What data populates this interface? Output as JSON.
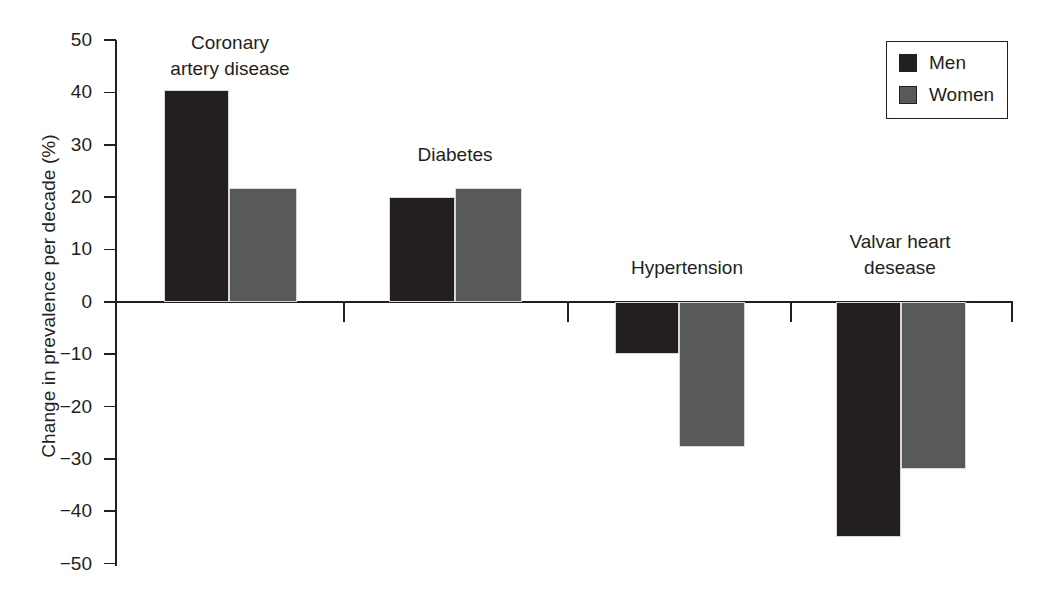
{
  "chart_data": {
    "type": "bar",
    "title": "",
    "xlabel": "",
    "ylabel": "Change in prevalence per decade (%)",
    "categories": [
      "Coronary\nartery disease",
      "Diabetes",
      "Hypertension",
      "Valvar heart\ndesease"
    ],
    "series": [
      {
        "name": "Men",
        "color": "#231f20",
        "values": [
          40.5,
          20.0,
          -10.0,
          -45.0
        ]
      },
      {
        "name": "Women",
        "color": "#58595b",
        "values": [
          21.8,
          21.8,
          -27.7,
          -32.0
        ]
      }
    ],
    "ylim": [
      -50,
      50
    ],
    "yticks": [
      50,
      40,
      30,
      20,
      10,
      0,
      -10,
      -20,
      -30,
      -40,
      -50
    ],
    "ytick_labels": [
      "50",
      "40",
      "30",
      "20",
      "10",
      "0",
      "−10",
      "−20",
      "−30",
      "−40",
      "−50"
    ],
    "grid": false,
    "legend": {
      "position": "top-right",
      "entries": [
        "Men",
        "Women"
      ]
    }
  },
  "legend": {
    "entries": [
      {
        "label": "Men"
      },
      {
        "label": "Women"
      }
    ]
  },
  "axis": {
    "y_title": "Change in prevalence per decade (%)",
    "tick_labels": [
      "50",
      "40",
      "30",
      "20",
      "10",
      "0",
      "−10",
      "−20",
      "−30",
      "−40",
      "−50"
    ]
  },
  "groups": [
    {
      "label": "Coronary\nartery disease",
      "men": 40.5,
      "women": 21.8
    },
    {
      "label": "Diabetes",
      "men": 20.0,
      "women": 21.8
    },
    {
      "label": "Hypertension",
      "men": -10.0,
      "women": -27.7
    },
    {
      "label": "Valvar heart\ndesease",
      "men": -45.0,
      "women": -32.0
    }
  ]
}
